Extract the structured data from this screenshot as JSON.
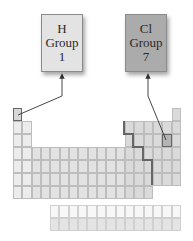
{
  "callouts": [
    {
      "id": "hydrogen",
      "symbol": "H",
      "group_label": "Group",
      "group_number": "1",
      "fill": "#e3e3e3",
      "x": 41,
      "y": 14,
      "w": 42,
      "h": 58
    },
    {
      "id": "chlorine",
      "symbol": "Cl",
      "group_label": "Group",
      "group_number": "7",
      "fill": "#ababab",
      "x": 125,
      "y": 14,
      "w": 42,
      "h": 58
    }
  ],
  "table": {
    "origin_x": 13,
    "origin_y": 108,
    "cell_w": 9.33,
    "cell_h": 13,
    "colors": {
      "s_block": "#ececec",
      "d_block": "#e2e2e2",
      "p_metal": "#e2e2e2",
      "p_nonmetal": "#dadada",
      "highlight_h": "#d8d8d8",
      "highlight_cl": "#b4b4b4",
      "f_top": "#f7f7f7",
      "f_bottom": "#e4e4e4"
    },
    "f_block": {
      "x": 50,
      "y": 205,
      "cols": 14,
      "rows": 2,
      "cell_w": 9.36,
      "cell_h": 13
    }
  },
  "arrows": [
    {
      "from": "H cell",
      "to": "H callout",
      "points": "18,115 62,96 62,76"
    },
    {
      "from": "Cl cell",
      "to": "Cl callout",
      "points": "166,140 148,96 148,76"
    }
  ],
  "metal_nonmetal_line": {
    "points": "124,121 124,134 133,134 133,147 143,147 143,160 152,160 152,185"
  }
}
